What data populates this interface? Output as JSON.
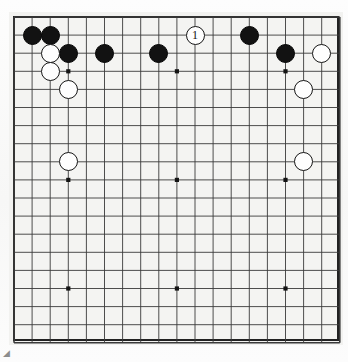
{
  "figure": {
    "board_size": 19,
    "corner_mark": "◢"
  },
  "colors": {
    "page_background": "#ffffff",
    "board_background": "#f4f4f2",
    "board_border": "#222222",
    "grid_line": "#3a3a3a",
    "black_stone": "#121212",
    "white_stone": "#fefefe",
    "white_stone_outline": "#161616",
    "star_point": "#141414"
  },
  "geometry": {
    "origin_x": 14,
    "origin_y": 17,
    "spacing": 18.1,
    "lines": 19,
    "stone_diameter": 19
  },
  "chart_data": {
    "type": "scatter",
    "xlabel": "",
    "ylabel": "",
    "board_size": 19,
    "star_points": [
      {
        "col": 3,
        "row": 3
      },
      {
        "col": 9,
        "row": 3
      },
      {
        "col": 15,
        "row": 3
      },
      {
        "col": 3,
        "row": 9
      },
      {
        "col": 9,
        "row": 9
      },
      {
        "col": 15,
        "row": 9
      },
      {
        "col": 3,
        "row": 15
      },
      {
        "col": 9,
        "row": 15
      },
      {
        "col": 15,
        "row": 15
      }
    ],
    "series": [
      {
        "name": "Black",
        "color": "#121212",
        "stones": [
          {
            "col": 1,
            "row": 1,
            "label": ""
          },
          {
            "col": 2,
            "row": 1,
            "label": ""
          },
          {
            "col": 3,
            "row": 2,
            "label": ""
          },
          {
            "col": 5,
            "row": 2,
            "label": ""
          },
          {
            "col": 8,
            "row": 2,
            "label": ""
          },
          {
            "col": 13,
            "row": 1,
            "label": ""
          },
          {
            "col": 15,
            "row": 2,
            "label": ""
          }
        ]
      },
      {
        "name": "White",
        "color": "#fefefe",
        "stones": [
          {
            "col": 2,
            "row": 2,
            "label": ""
          },
          {
            "col": 2,
            "row": 3,
            "label": ""
          },
          {
            "col": 3,
            "row": 4,
            "label": ""
          },
          {
            "col": 3,
            "row": 8,
            "label": ""
          },
          {
            "col": 10,
            "row": 1,
            "label": "1"
          },
          {
            "col": 17,
            "row": 2,
            "label": ""
          },
          {
            "col": 16,
            "row": 4,
            "label": ""
          },
          {
            "col": 16,
            "row": 8,
            "label": ""
          }
        ]
      }
    ]
  }
}
